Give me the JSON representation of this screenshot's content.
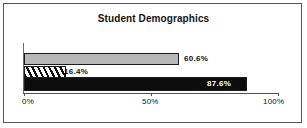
{
  "chart_data": {
    "type": "bar",
    "orientation": "horizontal",
    "title": "Student Demographics",
    "xlabel": "",
    "ylabel": "",
    "xlim": [
      0,
      100
    ],
    "grid": false,
    "legend": null,
    "categories": [
      "series-1",
      "series-2",
      "series-3"
    ],
    "values": [
      60.6,
      16.4,
      87.6
    ],
    "data_labels": [
      "60.6%",
      "16.4%",
      "87.6%"
    ],
    "tick_labels": [
      "0%",
      "50%",
      "100%"
    ],
    "tick_values": [
      0,
      50,
      100
    ],
    "series": [
      {
        "name": "series-1",
        "value": 60.6,
        "label": "60.6%",
        "fill": "#b8b8b8",
        "style": "solid-grey"
      },
      {
        "name": "series-2",
        "value": 16.4,
        "label": "16.4%",
        "fill": "#ffffff",
        "style": "diagonal-hatch"
      },
      {
        "name": "series-3",
        "value": 87.6,
        "label": "87.6%",
        "fill": "#0c0c0c",
        "style": "solid-black"
      }
    ],
    "colors": {
      "bar_grey": "#b8b8b8",
      "bar_black": "#0c0c0c",
      "bar_hatch_bg": "#ffffff",
      "bar_outline": "#1a1c1e",
      "axis": "#4f5254",
      "frame_border": "#55595c",
      "background": "#ffffff",
      "text": "#111316",
      "label_on_dark": "#ffffff"
    }
  }
}
